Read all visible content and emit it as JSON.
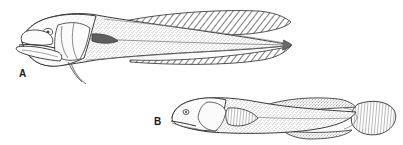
{
  "plate": {
    "kind": "scientific-illustration",
    "medium": "pen-and-ink stipple line drawing",
    "background_color": "#ffffff",
    "ink_color": "#3a3a3a",
    "subject": "two elongate fishes in lateral view",
    "figures": [
      {
        "id": "A",
        "label": "A",
        "label_position": {
          "x": 19,
          "y": 69
        },
        "orientation": "head-left, lateral view",
        "body_form": "very elongate, tapering, eel-like",
        "tail_shape": "pointed, confluent with dorsal and anal fins",
        "head": "large, blunt, with big oblique mouth and prominent lower jaw",
        "fins": [
          "long continuous dorsal fin with oblique hatching",
          "long continuous anal fin with oblique hatching",
          "small dark pectoral fin behind head",
          "thin filamentous pelvic rays below head"
        ],
        "shading": "fine stipple on body, diagonal hatch on fins",
        "extent": {
          "x": 10,
          "y": 8,
          "width": 285,
          "height": 80
        }
      },
      {
        "id": "B",
        "label": "B",
        "label_position": {
          "x": 154,
          "y": 117
        },
        "orientation": "head-left, lateral view",
        "body_form": "moderately elongate, stout, goby-like",
        "tail_shape": "rounded fan-shaped caudal fin with radiating rays",
        "head": "blunt, rounded snout with small terminal mouth",
        "fins": [
          "low dorsal fin along back",
          "rounded pectoral fin behind head",
          "low anal fin along belly",
          "rounded caudal fin"
        ],
        "shading": "fine stipple on body, radiating lines on caudal fin",
        "extent": {
          "x": 168,
          "y": 92,
          "width": 230,
          "height": 50
        }
      }
    ]
  }
}
